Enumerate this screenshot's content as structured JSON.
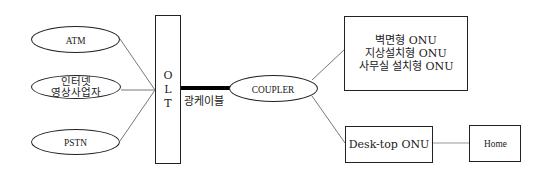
{
  "diagram": {
    "type": "network-topology",
    "sources": [
      {
        "id": "atm",
        "label": "ATM"
      },
      {
        "id": "internet-video",
        "label_lines": [
          "인터넷",
          "영상사업자"
        ]
      },
      {
        "id": "pstn",
        "label": "PSTN"
      }
    ],
    "olt": {
      "letters": [
        "O",
        "L",
        "T"
      ],
      "label": "OLT"
    },
    "cable": {
      "label": "광케이블"
    },
    "coupler": {
      "label": "COUPLER"
    },
    "onu_group": {
      "lines": [
        "벽면형 ONU",
        "지상설치형 ONU",
        "사무실 설치형 ONU"
      ]
    },
    "desktop_onu": {
      "label": "Desk-top ONU"
    },
    "home": {
      "label": "Home"
    },
    "connections": [
      [
        "ATM",
        "OLT"
      ],
      [
        "인터넷 영상사업자",
        "OLT"
      ],
      [
        "PSTN",
        "OLT"
      ],
      [
        "OLT",
        "COUPLER",
        "광케이블"
      ],
      [
        "COUPLER",
        "벽면형/지상설치형/사무실 설치형 ONU"
      ],
      [
        "COUPLER",
        "Desk-top ONU"
      ],
      [
        "Desk-top ONU",
        "Home"
      ]
    ],
    "colors": {
      "line": "#222222",
      "thin_line": "#777777",
      "background": "#ffffff"
    }
  }
}
